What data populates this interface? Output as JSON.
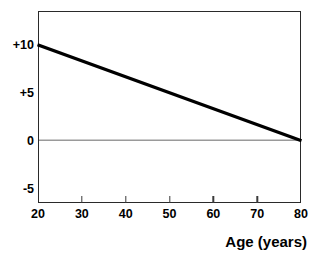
{
  "chart_data": {
    "type": "line",
    "title": "",
    "title_truncated": true,
    "xlabel": "Age (years)",
    "ylabel": "",
    "xlim": [
      20,
      80
    ],
    "ylim": [
      -6.5,
      13.5
    ],
    "xticks": [
      20,
      30,
      40,
      50,
      60,
      70,
      80
    ],
    "xtick_labels": [
      "20",
      "30",
      "40",
      "50",
      "60",
      "70",
      "80"
    ],
    "yticks": [
      10,
      5,
      0,
      -5
    ],
    "ytick_labels": [
      "+10",
      "+5",
      "0",
      "-5"
    ],
    "grid": false,
    "legend": false,
    "zero_line": {
      "value": 0,
      "color": "#9a9a9a",
      "label": "zero-reference-line"
    },
    "series": [
      {
        "name": "trend",
        "color": "#000000",
        "width": 3.2,
        "x": [
          20,
          80
        ],
        "values": [
          10,
          0
        ],
        "points": [
          {
            "x": 20,
            "y": 10
          },
          {
            "x": 80,
            "y": 0
          }
        ]
      }
    ],
    "colors": {
      "line": "#000000",
      "frame": "#2a2a2a",
      "zero_line": "#9a9a9a",
      "text": "#000000",
      "background": "#ffffff"
    }
  }
}
